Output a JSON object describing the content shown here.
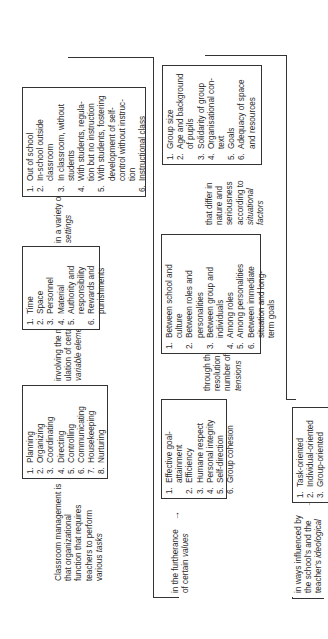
{
  "diagram": {
    "row1": {
      "intro": {
        "lines": [
          "Classroom management is",
          "that organizational",
          "function that requires",
          "teachers to perform"
        ],
        "last_plain": "various ",
        "last_em": "tasks",
        "arrow": "→"
      },
      "tasks": {
        "items": [
          {
            "num": "1.",
            "text": "Planning"
          },
          {
            "num": "2.",
            "text": "Organizing"
          },
          {
            "num": "3.",
            "text": "Coordinating"
          },
          {
            "num": "4.",
            "text": "Directing"
          },
          {
            "num": "5.",
            "text": "Controlling"
          },
          {
            "num": "6.",
            "text": "Communicating"
          },
          {
            "num": "7.",
            "text": "Housekeeping"
          },
          {
            "num": "8.",
            "text": "Nurturing"
          }
        ]
      },
      "elements_connector": {
        "line1": "involving the manip-",
        "line2": "ulation of certain",
        "line3_em": "variable elements",
        "arrow": "→"
      },
      "elements": {
        "items": [
          {
            "num": "1.",
            "text": "Time"
          },
          {
            "num": "2.",
            "text": "Space"
          },
          {
            "num": "3.",
            "text": "Personnel"
          },
          {
            "num": "4.",
            "text": "Material"
          },
          {
            "num": "5.",
            "text": "Authority and",
            "cont": "responsibility"
          },
          {
            "num": "6.",
            "text": "Rewards and",
            "cont": "punishments"
          }
        ]
      },
      "settings_connector": {
        "line1": "in a variety of",
        "line2_em": "settings",
        "arrow": "→"
      },
      "settings": {
        "items": [
          {
            "num": "1.",
            "text": "Out of school"
          },
          {
            "num": "2.",
            "text": "In-school outside",
            "cont": "classroom"
          },
          {
            "num": "3.",
            "text": "In classroom, without",
            "cont": "students"
          },
          {
            "num": "4.",
            "text": "With students, regula-",
            "cont": "tion but no instruction"
          },
          {
            "num": "5.",
            "text": "With students, fostering",
            "cont": "development of self-",
            "cont2": "control without instruc-",
            "cont3": "tion"
          },
          {
            "num": "6.",
            "text": "Instructional class"
          }
        ]
      }
    },
    "row2": {
      "values_connector": {
        "line1": "in the furtherance",
        "line2_plain": "of certain ",
        "line2_em": "values",
        "arrow": "→"
      },
      "values": {
        "items": [
          {
            "num": "1.",
            "text": "Effective goal-",
            "cont": "attainment"
          },
          {
            "num": "2.",
            "text": "Efficiency"
          },
          {
            "num": "3.",
            "text": "Humane respect"
          },
          {
            "num": "4.",
            "text": "Personal integrity"
          },
          {
            "num": "5.",
            "text": "Self-direction"
          },
          {
            "num": "6.",
            "text": "Group cohesion"
          }
        ]
      },
      "tensions_connector": {
        "line1": "through the",
        "line2": "resolution of a",
        "line3": "number of",
        "line4_em": "tensions",
        "arrow": "→"
      },
      "tensions": {
        "items": [
          {
            "num": "1.",
            "text": "Between school and",
            "cont": "culture"
          },
          {
            "num": "2.",
            "text": "Between roles and",
            "cont": "personalities"
          },
          {
            "num": "3.",
            "text": "Between group and",
            "cont": "individuals"
          },
          {
            "num": "4.",
            "text": "Among roles"
          },
          {
            "num": "5.",
            "text": "Among personalities"
          },
          {
            "num": "6.",
            "text": "Between immediate",
            "cont": "situation and long-",
            "cont2": "term goals"
          }
        ]
      },
      "factors_connector": {
        "line1": "that differ in",
        "line2": "nature and",
        "line3": "seriousness",
        "line4": "according to",
        "line5_em": "situational",
        "line6_em": "factors",
        "arrow": "→"
      },
      "factors": {
        "items": [
          {
            "num": "1.",
            "text": "Group size"
          },
          {
            "num": "2.",
            "text": "Age and background",
            "cont": "of pupils"
          },
          {
            "num": "3.",
            "text": "Solidarity of group"
          },
          {
            "num": "4.",
            "text": "Organisational con-",
            "cont": "text"
          },
          {
            "num": "5.",
            "text": "Goals"
          },
          {
            "num": "6.",
            "text": "Adequacy of space",
            "cont": "and resources"
          }
        ]
      }
    },
    "row3": {
      "ideology_connector": {
        "line1": "in ways influenced by",
        "line2": "the school's and the",
        "line3_plain": "teacher's ",
        "line3_em": "ideological",
        "arrow": "→"
      },
      "ideology": {
        "items": [
          {
            "num": "1.",
            "text": "Task-oriented"
          },
          {
            "num": "2.",
            "text": "Individual-oriented"
          },
          {
            "num": "3.",
            "text": "Group-oriented"
          }
        ]
      }
    }
  }
}
